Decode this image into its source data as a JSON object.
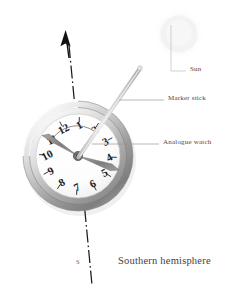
{
  "figure": {
    "title": "Southern hemisphere",
    "kind": "instructional-diagram",
    "background_color": "#ffffff"
  },
  "callouts": [
    {
      "id": "sun",
      "label": "Sun",
      "x": 190,
      "y": 71
    },
    {
      "id": "marker-stick",
      "label": "Marker stick",
      "x": 168,
      "y": 100
    },
    {
      "id": "analogue-watch",
      "label": "Analogue watch",
      "x": 163,
      "y": 144
    }
  ],
  "caption": {
    "label": "Southern hemisphere",
    "x": 118,
    "y": 262
  },
  "compass": {
    "south_label": "S",
    "south_label_x": 79,
    "south_label_y": 262,
    "bearing_line_color": "#1a1a1a"
  },
  "watch": {
    "dial_numbers": [
      "12",
      "1",
      "2",
      "3",
      "4",
      "5",
      "6",
      "7",
      "8",
      "9",
      "10",
      "11"
    ],
    "dial_rotation_degrees": -28,
    "center_x": 78,
    "center_y": 156,
    "dial_radius": 46,
    "hour_hand_angle_degrees": 290,
    "minute_hand_angle_degrees": 74,
    "bezel_color_light": "#d8d8d8",
    "bezel_color_dark": "#8a8a8a",
    "dial_face_color": "#fefefe",
    "numeral_color": "#1d1d1d",
    "hand_color": "#7a7a7a"
  },
  "sun": {
    "center_x": 179,
    "center_y": 34,
    "radius": 19,
    "color": "#f2f2f2",
    "glow_color": "#f8f8f8"
  },
  "marker_stick": {
    "color_light": "#e6e6e6",
    "color_dark": "#b4b4b4",
    "tip_x": 139,
    "tip_y": 69
  },
  "angle_arc": {
    "shown": true,
    "color": "#555555",
    "description": "bisected angle between hour hand and 12 o'clock"
  },
  "north_arrow": {
    "shown": true,
    "color": "#111111",
    "tip_x": 67,
    "tip_y": 36
  }
}
